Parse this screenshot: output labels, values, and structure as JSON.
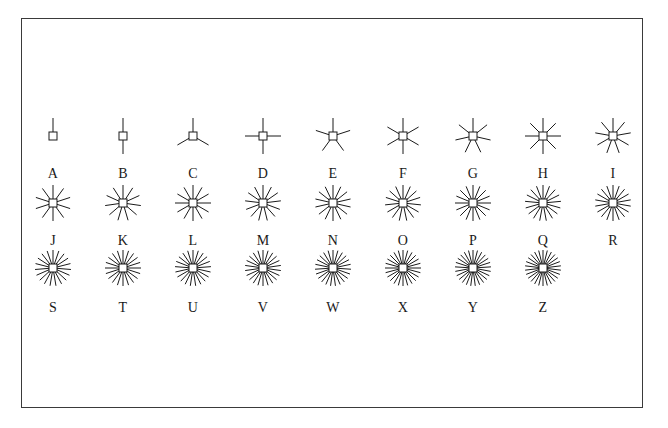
{
  "figure": {
    "frame": {
      "x": 21,
      "y": 18,
      "width": 622,
      "height": 390,
      "border_color": "#3a3a3a",
      "background_color": "#ffffff"
    },
    "ink_color": "#1a1a1a",
    "rows": 3,
    "columns": 9,
    "column_spacing": 70,
    "first_column_x": 53,
    "marker_row_y": [
      136,
      203,
      268
    ],
    "label_row_y": [
      167,
      234,
      301
    ],
    "marker_square_size": 8,
    "ray_length": 18
  },
  "chart_data": {
    "type": "scatter",
    "xlabel": "",
    "ylabel": "",
    "grid": false,
    "legend": "none",
    "series": [
      {
        "name": "asterisk markers",
        "labels": [
          "A",
          "B",
          "C",
          "D",
          "E",
          "F",
          "G",
          "H",
          "I",
          "J",
          "K",
          "L",
          "M",
          "N",
          "O",
          "P",
          "Q",
          "R",
          "S",
          "T",
          "U",
          "V",
          "W",
          "X",
          "Y",
          "Z"
        ],
        "ray_counts": [
          1,
          2,
          3,
          4,
          5,
          6,
          7,
          8,
          9,
          10,
          11,
          12,
          13,
          14,
          15,
          16,
          17,
          18,
          19,
          20,
          21,
          22,
          23,
          24,
          25,
          26
        ]
      }
    ],
    "rows": [
      {
        "row_index": 0,
        "items": [
          {
            "label": "A",
            "rays": 1,
            "col": 0,
            "cx": 53,
            "cy": 136,
            "label_y": 167
          },
          {
            "label": "B",
            "rays": 2,
            "col": 1,
            "cx": 123,
            "cy": 136,
            "label_y": 167
          },
          {
            "label": "C",
            "rays": 3,
            "col": 2,
            "cx": 193,
            "cy": 136,
            "label_y": 167
          },
          {
            "label": "D",
            "rays": 4,
            "col": 3,
            "cx": 263,
            "cy": 136,
            "label_y": 167
          },
          {
            "label": "E",
            "rays": 5,
            "col": 4,
            "cx": 333,
            "cy": 136,
            "label_y": 167
          },
          {
            "label": "F",
            "rays": 6,
            "col": 5,
            "cx": 403,
            "cy": 136,
            "label_y": 167
          },
          {
            "label": "G",
            "rays": 7,
            "col": 6,
            "cx": 473,
            "cy": 136,
            "label_y": 167
          },
          {
            "label": "H",
            "rays": 8,
            "col": 7,
            "cx": 543,
            "cy": 136,
            "label_y": 167
          },
          {
            "label": "I",
            "rays": 9,
            "col": 8,
            "cx": 613,
            "cy": 136,
            "label_y": 167
          }
        ]
      },
      {
        "row_index": 1,
        "items": [
          {
            "label": "J",
            "rays": 10,
            "col": 0,
            "cx": 53,
            "cy": 203,
            "label_y": 234
          },
          {
            "label": "K",
            "rays": 11,
            "col": 1,
            "cx": 123,
            "cy": 203,
            "label_y": 234
          },
          {
            "label": "L",
            "rays": 12,
            "col": 2,
            "cx": 193,
            "cy": 203,
            "label_y": 234
          },
          {
            "label": "M",
            "rays": 13,
            "col": 3,
            "cx": 263,
            "cy": 203,
            "label_y": 234
          },
          {
            "label": "N",
            "rays": 14,
            "col": 4,
            "cx": 333,
            "cy": 203,
            "label_y": 234
          },
          {
            "label": "O",
            "rays": 15,
            "col": 5,
            "cx": 403,
            "cy": 203,
            "label_y": 234
          },
          {
            "label": "P",
            "rays": 16,
            "col": 6,
            "cx": 473,
            "cy": 203,
            "label_y": 234
          },
          {
            "label": "Q",
            "rays": 17,
            "col": 7,
            "cx": 543,
            "cy": 203,
            "label_y": 234
          },
          {
            "label": "R",
            "rays": 18,
            "col": 8,
            "cx": 613,
            "cy": 203,
            "label_y": 234
          }
        ]
      },
      {
        "row_index": 2,
        "items": [
          {
            "label": "S",
            "rays": 19,
            "col": 0,
            "cx": 53,
            "cy": 268,
            "label_y": 301
          },
          {
            "label": "T",
            "rays": 20,
            "col": 1,
            "cx": 123,
            "cy": 268,
            "label_y": 301
          },
          {
            "label": "U",
            "rays": 21,
            "col": 2,
            "cx": 193,
            "cy": 268,
            "label_y": 301
          },
          {
            "label": "V",
            "rays": 22,
            "col": 3,
            "cx": 263,
            "cy": 268,
            "label_y": 301
          },
          {
            "label": "W",
            "rays": 23,
            "col": 4,
            "cx": 333,
            "cy": 268,
            "label_y": 301
          },
          {
            "label": "X",
            "rays": 24,
            "col": 5,
            "cx": 403,
            "cy": 268,
            "label_y": 301
          },
          {
            "label": "Y",
            "rays": 25,
            "col": 6,
            "cx": 473,
            "cy": 268,
            "label_y": 301
          },
          {
            "label": "Z",
            "rays": 26,
            "col": 7,
            "cx": 543,
            "cy": 268,
            "label_y": 301
          }
        ]
      }
    ]
  }
}
